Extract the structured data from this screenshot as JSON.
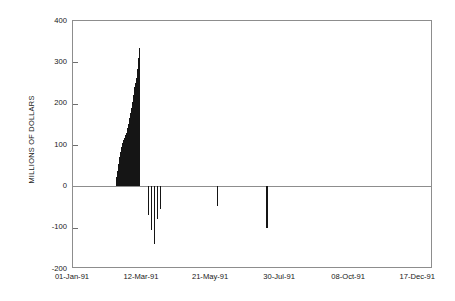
{
  "chart_data": {
    "type": "bar",
    "title": "",
    "subtitle": "",
    "xlabel": "",
    "ylabel": "MILLIONS OF DOLLARS",
    "ylim": [
      -200,
      400
    ],
    "yticks": [
      400,
      300,
      200,
      100,
      0,
      -100,
      -200
    ],
    "ytick_labels": [
      "400",
      "300",
      "200",
      "100",
      "0",
      "-100",
      "-200"
    ],
    "xlim": [
      "01-Jan-91",
      "31-Dec-91"
    ],
    "xtick_labels": [
      "01-Jan-91",
      "12-Mar-91",
      "21-May-91",
      "30-Jul-91",
      "08-Oct-91",
      "17-Dec-91"
    ],
    "xtick_positions_days": [
      0,
      70,
      140,
      210,
      280,
      350
    ],
    "grid": false,
    "legend": null,
    "bar_color": "#151515",
    "axis_color": "#8d8d8d",
    "series": [
      {
        "name": "Daily net flow",
        "x_days": [
          44,
          45,
          46,
          47,
          48,
          49,
          50,
          51,
          52,
          53,
          54,
          55,
          56,
          57,
          58,
          59,
          60,
          61,
          62,
          63,
          64,
          65,
          66,
          67,
          76,
          79,
          82,
          85,
          88,
          146,
          196
        ],
        "values": [
          22,
          36,
          55,
          70,
          84,
          96,
          104,
          112,
          118,
          124,
          130,
          140,
          150,
          165,
          178,
          190,
          205,
          222,
          240,
          250,
          262,
          285,
          310,
          335,
          -70,
          -105,
          -140,
          -80,
          -55,
          -48,
          -100
        ]
      }
    ]
  },
  "figure": {
    "background_color": "#ffffff",
    "plot": {
      "left_px": 72,
      "top_px": 20,
      "width_px": 360,
      "height_px": 248
    }
  }
}
